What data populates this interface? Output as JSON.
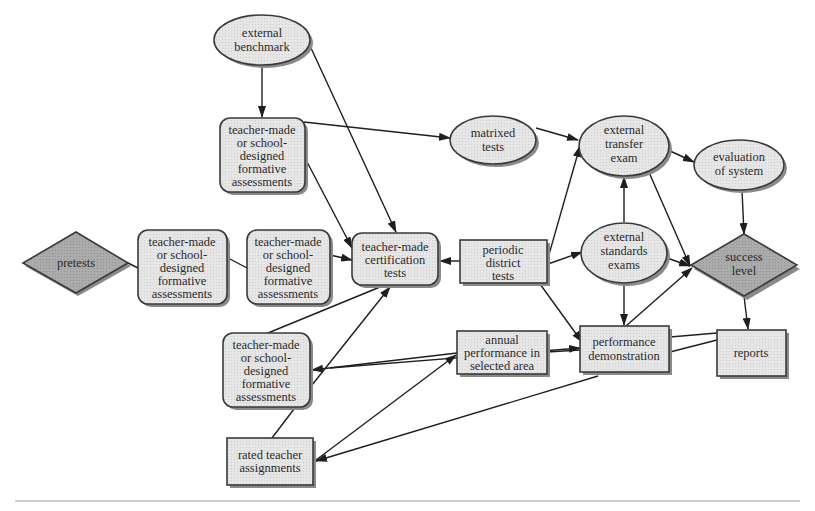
{
  "diagram": {
    "colors": {
      "light_fill": "#e4e4e4",
      "dark_fill": "#a9a9a9",
      "stroke": "#3a3a3a",
      "edge": "#1e1e1e",
      "rule": "#9a9a9a"
    },
    "nodes": {
      "external_benchmark": {
        "shape": "ellipse",
        "lines": [
          "external",
          "benchmark"
        ]
      },
      "formative_top": {
        "shape": "rounded-rect",
        "lines": [
          "teacher-made",
          "or school-",
          "designed",
          "formative",
          "assessments"
        ]
      },
      "matrixed_tests": {
        "shape": "ellipse",
        "lines": [
          "matrixed",
          "tests"
        ]
      },
      "external_transfer_exam": {
        "shape": "ellipse",
        "lines": [
          "external",
          "transfer",
          "exam"
        ]
      },
      "evaluation_of_system": {
        "shape": "ellipse",
        "lines": [
          "evaluation",
          "of system"
        ]
      },
      "pretests": {
        "shape": "diamond",
        "lines": [
          "pretests"
        ]
      },
      "formative_left": {
        "shape": "rounded-rect",
        "lines": [
          "teacher-made",
          "or school-",
          "designed",
          "formative",
          "assessments"
        ]
      },
      "formative_middle": {
        "shape": "rounded-rect",
        "lines": [
          "teacher-made",
          "or school-",
          "designed",
          "formative",
          "assessments"
        ]
      },
      "certification_tests": {
        "shape": "rounded-rect",
        "lines": [
          "teacher-made",
          "certification",
          "tests"
        ]
      },
      "periodic_district_tests": {
        "shape": "rect",
        "lines": [
          "periodic",
          "district",
          "tests"
        ]
      },
      "external_standards_exams": {
        "shape": "ellipse",
        "lines": [
          "external",
          "standards",
          "exams"
        ]
      },
      "success_level": {
        "shape": "diamond",
        "lines": [
          "success",
          "level"
        ]
      },
      "formative_bottom": {
        "shape": "rounded-rect",
        "lines": [
          "teacher-made",
          "or school-",
          "designed",
          "formative",
          "assessments"
        ]
      },
      "annual_performance": {
        "shape": "rect",
        "lines": [
          "annual",
          "performance in",
          "selected area"
        ]
      },
      "performance_demonstration": {
        "shape": "rect",
        "lines": [
          "performance",
          "demonstration"
        ]
      },
      "reports": {
        "shape": "rect",
        "lines": [
          "reports"
        ]
      },
      "rated_teacher_assignments": {
        "shape": "rect",
        "lines": [
          "rated teacher",
          "assignments"
        ]
      }
    },
    "edges": [
      {
        "from": "external_benchmark",
        "to": "formative_top",
        "arrow": true
      },
      {
        "from": "external_benchmark",
        "to": "certification_tests",
        "arrow": true
      },
      {
        "from": "formative_top",
        "to": "matrixed_tests",
        "arrow": true
      },
      {
        "from": "formative_top",
        "to": "certification_tests",
        "arrow": true
      },
      {
        "from": "matrixed_tests",
        "to": "external_transfer_exam",
        "arrow": true
      },
      {
        "from": "external_transfer_exam",
        "to": "evaluation_of_system",
        "arrow": true
      },
      {
        "from": "external_transfer_exam",
        "to": "success_level",
        "arrow": true
      },
      {
        "from": "evaluation_of_system",
        "to": "success_level",
        "arrow": true
      },
      {
        "from": "pretests",
        "to": "formative_left",
        "arrow": false
      },
      {
        "from": "formative_left",
        "to": "formative_middle",
        "arrow": false
      },
      {
        "from": "formative_middle",
        "to": "certification_tests",
        "arrow": true
      },
      {
        "from": "periodic_district_tests",
        "to": "certification_tests",
        "arrow": true
      },
      {
        "from": "periodic_district_tests",
        "to": "external_transfer_exam",
        "arrow": true
      },
      {
        "from": "periodic_district_tests",
        "to": "external_standards_exams",
        "arrow": true
      },
      {
        "from": "periodic_district_tests",
        "to": "performance_demonstration",
        "arrow": true
      },
      {
        "from": "external_standards_exams",
        "to": "external_transfer_exam",
        "arrow": true
      },
      {
        "from": "external_standards_exams",
        "to": "success_level",
        "arrow": true
      },
      {
        "from": "external_standards_exams",
        "to": "performance_demonstration",
        "arrow": true
      },
      {
        "from": "performance_demonstration",
        "to": "success_level",
        "arrow": true
      },
      {
        "from": "success_level",
        "to": "reports",
        "arrow": true
      },
      {
        "from": "performance_demonstration",
        "to": "reports",
        "arrow": false
      },
      {
        "from": "formative_bottom",
        "to": "certification_tests",
        "arrow": false
      },
      {
        "from": "rated_teacher_assignments",
        "to": "certification_tests",
        "arrow": true
      },
      {
        "from": "annual_performance",
        "to": "formative_bottom",
        "arrow": true
      },
      {
        "from": "formative_bottom",
        "to": "performance_demonstration",
        "arrow": true
      },
      {
        "from": "rated_teacher_assignments",
        "to": "annual_performance",
        "arrow": true
      },
      {
        "from": "reports",
        "to": "rated_teacher_assignments",
        "arrow": true
      },
      {
        "from": "formative_bottom",
        "to": "rated_teacher_assignments",
        "arrow": false
      }
    ]
  }
}
